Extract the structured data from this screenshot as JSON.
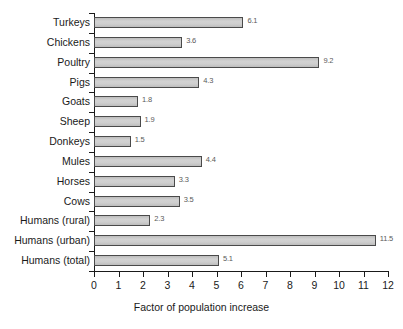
{
  "chart_data": {
    "type": "bar",
    "orientation": "horizontal",
    "title": "",
    "xlabel": "Factor of population increase",
    "ylabel": "",
    "xlim": [
      0,
      12
    ],
    "xticks": [
      0,
      1,
      2,
      3,
      4,
      5,
      6,
      7,
      8,
      9,
      10,
      11,
      12
    ],
    "grid": false,
    "legend": null,
    "bar_color": "#c9c9c9",
    "bar_edge_color": "#4a4a4a",
    "categories": [
      "Turkeys",
      "Chickens",
      "Poultry",
      "Pigs",
      "Goats",
      "Sheep",
      "Donkeys",
      "Mules",
      "Horses",
      "Cows",
      "Humans (rural)",
      "Humans (urban)",
      "Humans (total)"
    ],
    "values": [
      6.1,
      3.6,
      9.2,
      4.3,
      1.8,
      1.9,
      1.5,
      4.4,
      3.3,
      3.5,
      2.3,
      11.5,
      5.1
    ],
    "data_labels": [
      "6.1",
      "3.6",
      "9.2",
      "4.3",
      "1.8",
      "1.9",
      "1.5",
      "4.4",
      "3.3",
      "3.5",
      "2.3",
      "11.5",
      "5.1"
    ],
    "xtick_labels": [
      "0",
      "1",
      "2",
      "3",
      "4",
      "5",
      "6",
      "7",
      "8",
      "9",
      "10",
      "11",
      "12"
    ]
  }
}
